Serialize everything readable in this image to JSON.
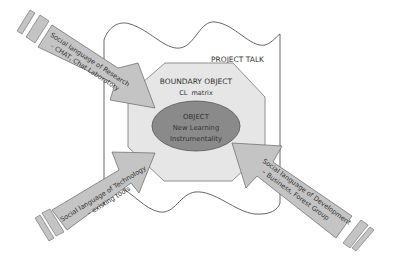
{
  "diagram": {
    "project_talk_label": "PROJECT TALK",
    "boundary_object": {
      "title": "BOUNDARY OBJECT",
      "subtitle": "CL  matrix"
    },
    "object": {
      "title": "OBJECT",
      "line1": "New Learning",
      "line2": "Instrumentality"
    },
    "arrows": [
      {
        "id": "research",
        "line1": "Social language of Research",
        "line2": "– CHAT, Chat Laboratory"
      },
      {
        "id": "technology",
        "line1": "Social language of Technology",
        "line2": "– existing tools"
      },
      {
        "id": "development",
        "line1": "Social language of Development",
        "line2": "– Business, Forest Group"
      }
    ],
    "colors": {
      "arrow_fill": "#c4c4c4",
      "boundary_fill": "#e6e6e6",
      "object_fill": "#8a8a8a",
      "stroke": "#555555"
    }
  }
}
